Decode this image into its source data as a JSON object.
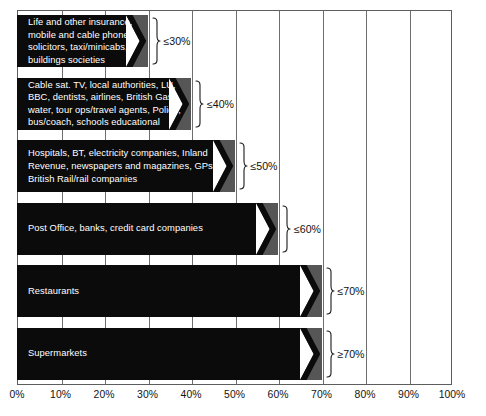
{
  "chart_data": {
    "type": "bar",
    "title": "",
    "subtitle": "",
    "xlabel": "",
    "ylabel": "",
    "orientation": "horizontal",
    "xlim": [
      0,
      100
    ],
    "grid": true,
    "legend": false,
    "legend_position": "none",
    "xticks": [
      "0%",
      "10%",
      "20%",
      "30%",
      "40%",
      "50%",
      "60%",
      "70%",
      "80%",
      "90%",
      "100%"
    ],
    "xtick_values": [
      0,
      10,
      20,
      30,
      40,
      50,
      60,
      70,
      80,
      90,
      100
    ],
    "categories": [
      "Life and other insurance, mobile and cable phone, solicitors, taxi/minicabs, buildings societies",
      "Cable sat. TV, local authorities, LU, BBC, dentists, airlines, British Gas, water, tour ops/travel agents, Police, bus/coach, schools educational",
      "Hospitals, BT, electricity companies, Inland Revenue, newspapers and magazines, GPs, British Rail/rail companies",
      "Post Office, banks, credit card companies",
      "Restaurants",
      "Supermarkets"
    ],
    "values": [
      30,
      40,
      50,
      60,
      70,
      70
    ],
    "annotations": [
      "≤30%",
      "≤40%",
      "≤50%",
      "≤60%",
      "≤70%",
      "≥70%"
    ],
    "bars": [
      {
        "label_lines": "Life and other insurance,\nmobile and cable phone,\nsolicitors, taxi/minicabs,\nbuildings societies",
        "value": 30,
        "annotation": "≤30%"
      },
      {
        "label_lines": "Cable sat. TV, local authorities, LU,\nBBC, dentists, airlines, British Gas,\nwater, tour ops/travel agents, Police,\nbus/coach, schools educational",
        "value": 40,
        "annotation": "≤40%"
      },
      {
        "label_lines": "Hospitals, BT, electricity companies, Inland\nRevenue, newspapers and magazines, GPs,\nBritish Rail/rail companies",
        "value": 50,
        "annotation": "≤50%"
      },
      {
        "label_lines": "Post Office, banks, credit card companies",
        "value": 60,
        "annotation": "≤60%"
      },
      {
        "label_lines": "Restaurants",
        "value": 70,
        "annotation": "≤70%"
      },
      {
        "label_lines": "Supermarkets",
        "value": 70,
        "annotation": "≥70%"
      }
    ]
  },
  "style": {
    "bar_color": "#0b0b0b",
    "wedge_color": "#565656",
    "grid_color": "#6e6e6e",
    "frame_color": "#5d5d5d",
    "label_text_color": "#ffffff",
    "axis_text_color": "#141414",
    "background": "#ffffff"
  }
}
